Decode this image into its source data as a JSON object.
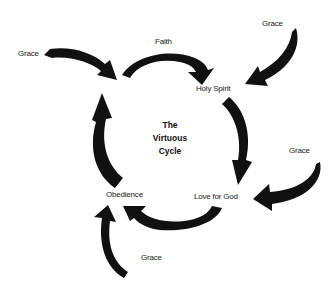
{
  "diagram": {
    "title_lines": [
      "The",
      "Virtuous",
      "Cycle"
    ],
    "nodes": {
      "faith": "Faith",
      "holy_spirit": "Holy Spirit",
      "love_for_god": "Love for God",
      "obedience": "Obedience"
    },
    "grace_labels": {
      "top_left": "Grace",
      "top_right": "Grace",
      "right": "Grace",
      "bottom": "Grace"
    },
    "arrow_color": "#111111",
    "cycle_order": [
      "Faith",
      "Holy Spirit",
      "Love for God",
      "Obedience"
    ]
  }
}
